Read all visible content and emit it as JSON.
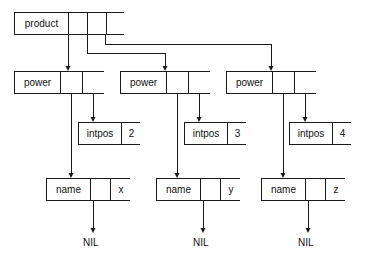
{
  "diagram": {
    "stroke_color": "#1a1a1a",
    "text_color": "#111111",
    "background": "#ffffff",
    "nodes": [
      {
        "id": "product",
        "label": "product",
        "x": 14,
        "y": 12,
        "w": 110,
        "h": 23,
        "cells": [
          {
            "kind": "label",
            "text": "product",
            "w": 54
          },
          {
            "kind": "ptr",
            "text": "",
            "w": 19
          },
          {
            "kind": "ptr",
            "text": "",
            "w": 19
          },
          {
            "kind": "ptr",
            "text": "",
            "w": 18
          }
        ]
      },
      {
        "id": "power1",
        "label": "power",
        "x": 14,
        "y": 71,
        "w": 90,
        "h": 23,
        "cells": [
          {
            "kind": "label",
            "text": "power",
            "w": 46
          },
          {
            "kind": "ptr",
            "text": "",
            "w": 22
          },
          {
            "kind": "ptr",
            "text": "",
            "w": 22
          }
        ]
      },
      {
        "id": "power2",
        "label": "power",
        "x": 120,
        "y": 71,
        "w": 90,
        "h": 23,
        "cells": [
          {
            "kind": "label",
            "text": "power",
            "w": 46
          },
          {
            "kind": "ptr",
            "text": "",
            "w": 22
          },
          {
            "kind": "ptr",
            "text": "",
            "w": 22
          }
        ]
      },
      {
        "id": "power3",
        "label": "power",
        "x": 226,
        "y": 71,
        "w": 90,
        "h": 23,
        "cells": [
          {
            "kind": "label",
            "text": "power",
            "w": 46
          },
          {
            "kind": "ptr",
            "text": "",
            "w": 22
          },
          {
            "kind": "ptr",
            "text": "",
            "w": 22
          }
        ]
      },
      {
        "id": "intpos1",
        "label": "intpos",
        "x": 78,
        "y": 122,
        "w": 62,
        "h": 23,
        "cells": [
          {
            "kind": "label",
            "text": "intpos",
            "w": 43
          },
          {
            "kind": "value",
            "text": "2",
            "w": 19
          }
        ]
      },
      {
        "id": "intpos2",
        "label": "intpos",
        "x": 184,
        "y": 122,
        "w": 62,
        "h": 23,
        "cells": [
          {
            "kind": "label",
            "text": "intpos",
            "w": 43
          },
          {
            "kind": "value",
            "text": "3",
            "w": 19
          }
        ]
      },
      {
        "id": "intpos3",
        "label": "intpos",
        "x": 289,
        "y": 122,
        "w": 62,
        "h": 23,
        "cells": [
          {
            "kind": "label",
            "text": "intpos",
            "w": 43
          },
          {
            "kind": "value",
            "text": "4",
            "w": 19
          }
        ]
      },
      {
        "id": "name1",
        "label": "name",
        "x": 46,
        "y": 178,
        "w": 84,
        "h": 23,
        "cells": [
          {
            "kind": "label",
            "text": "name",
            "w": 44
          },
          {
            "kind": "ptr",
            "text": "",
            "w": 20
          },
          {
            "kind": "value",
            "text": "x",
            "w": 20
          }
        ]
      },
      {
        "id": "name2",
        "label": "name",
        "x": 156,
        "y": 178,
        "w": 84,
        "h": 23,
        "cells": [
          {
            "kind": "label",
            "text": "name",
            "w": 44
          },
          {
            "kind": "ptr",
            "text": "",
            "w": 20
          },
          {
            "kind": "value",
            "text": "y",
            "w": 20
          }
        ]
      },
      {
        "id": "name3",
        "label": "name",
        "x": 261,
        "y": 178,
        "w": 84,
        "h": 23,
        "cells": [
          {
            "kind": "label",
            "text": "name",
            "w": 44
          },
          {
            "kind": "ptr",
            "text": "",
            "w": 20
          },
          {
            "kind": "value",
            "text": "z",
            "w": 20
          }
        ]
      }
    ],
    "terminals": [
      {
        "id": "nil1",
        "text": "NIL",
        "x": 83,
        "y": 238
      },
      {
        "id": "nil2",
        "text": "NIL",
        "x": 193,
        "y": 238
      },
      {
        "id": "nil3",
        "text": "NIL",
        "x": 298,
        "y": 238
      }
    ],
    "edges": [
      {
        "id": "product-to-power1",
        "from": "product",
        "to": "power1",
        "points": [
          [
            68,
            35
          ],
          [
            68,
            69
          ]
        ]
      },
      {
        "id": "product-to-power2",
        "from": "product",
        "to": "power2",
        "points": [
          [
            87,
            35
          ],
          [
            87,
            53
          ],
          [
            165,
            53
          ],
          [
            165,
            69
          ]
        ]
      },
      {
        "id": "product-to-power3",
        "from": "product",
        "to": "power3",
        "points": [
          [
            105,
            35
          ],
          [
            105,
            44
          ],
          [
            271,
            44
          ],
          [
            271,
            69
          ]
        ]
      },
      {
        "id": "power1-to-name1",
        "from": "power1",
        "to": "name1",
        "points": [
          [
            71,
            94
          ],
          [
            71,
            176
          ]
        ]
      },
      {
        "id": "power1-to-intpos1",
        "from": "power1",
        "to": "intpos1",
        "points": [
          [
            93,
            94
          ],
          [
            93,
            120
          ]
        ]
      },
      {
        "id": "power2-to-name2",
        "from": "power2",
        "to": "name2",
        "points": [
          [
            177,
            94
          ],
          [
            177,
            176
          ]
        ]
      },
      {
        "id": "power2-to-intpos2",
        "from": "power2",
        "to": "intpos2",
        "points": [
          [
            199,
            94
          ],
          [
            199,
            120
          ]
        ]
      },
      {
        "id": "power3-to-name3",
        "from": "power3",
        "to": "name3",
        "points": [
          [
            283,
            94
          ],
          [
            283,
            176
          ]
        ]
      },
      {
        "id": "power3-to-intpos3",
        "from": "power3",
        "to": "intpos3",
        "points": [
          [
            305,
            94
          ],
          [
            305,
            120
          ]
        ]
      },
      {
        "id": "name1-to-nil1",
        "from": "name1",
        "to": "nil1",
        "points": [
          [
            93,
            201
          ],
          [
            93,
            231
          ]
        ]
      },
      {
        "id": "name2-to-nil2",
        "from": "name2",
        "to": "nil2",
        "points": [
          [
            203,
            201
          ],
          [
            203,
            231
          ]
        ]
      },
      {
        "id": "name3-to-nil3",
        "from": "name3",
        "to": "nil3",
        "points": [
          [
            308,
            201
          ],
          [
            308,
            231
          ]
        ]
      }
    ]
  }
}
